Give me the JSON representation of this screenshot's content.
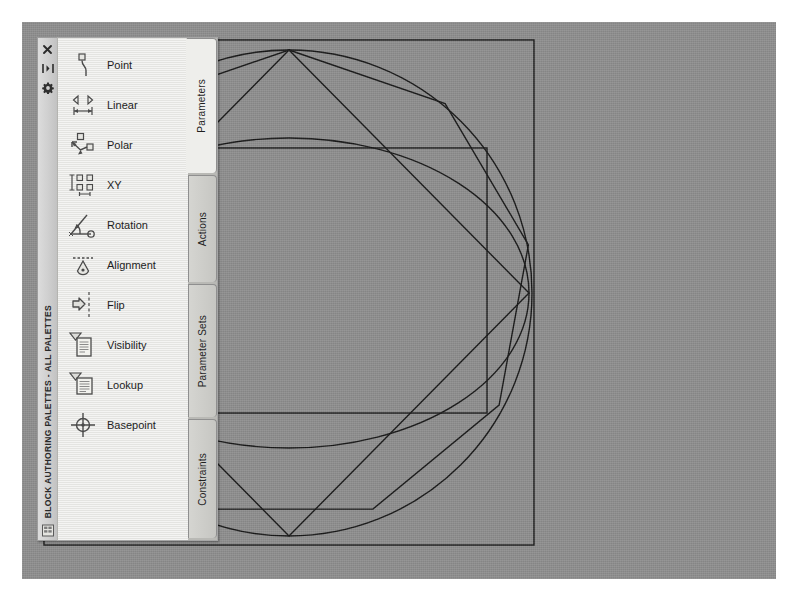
{
  "window": {
    "title": "BLOCK AUTHORING PALETTES - ALL PALETTES",
    "titlebar_icons": [
      {
        "name": "close-icon",
        "glyph": "✕"
      },
      {
        "name": "auto-hide-icon",
        "glyph": "▸◂"
      },
      {
        "name": "properties-gear-icon",
        "glyph": "⚙"
      }
    ],
    "status_icon": "palette-properties-icon"
  },
  "tabs": [
    {
      "label": "Parameters",
      "active": true
    },
    {
      "label": "Actions",
      "active": false
    },
    {
      "label": "Parameter Sets",
      "active": false
    },
    {
      "label": "Constraints",
      "active": false
    }
  ],
  "tools": [
    {
      "label": "Point",
      "icon": "point-parameter-icon"
    },
    {
      "label": "Linear",
      "icon": "linear-parameter-icon"
    },
    {
      "label": "Polar",
      "icon": "polar-parameter-icon"
    },
    {
      "label": "XY",
      "icon": "xy-parameter-icon"
    },
    {
      "label": "Rotation",
      "icon": "rotation-parameter-icon"
    },
    {
      "label": "Alignment",
      "icon": "alignment-parameter-icon"
    },
    {
      "label": "Flip",
      "icon": "flip-parameter-icon"
    },
    {
      "label": "Visibility",
      "icon": "visibility-parameter-icon"
    },
    {
      "label": "Lookup",
      "icon": "lookup-parameter-icon"
    },
    {
      "label": "Basepoint",
      "icon": "basepoint-parameter-icon"
    }
  ],
  "colors": {
    "canvas_background": "#8f8f8f",
    "palette_background": "#e9e9e6",
    "titlebar_background": "#cfcfcf",
    "tab_inactive": "#c6c6c2",
    "tab_active": "#eeeeeb",
    "geometry_stroke": "#1a1a1a",
    "page_background": "#ffffff"
  },
  "drawing": {
    "description": "Block geometry: outer square, circumscribed circle, regular nonagon, rotated inner square, horizontal ellipse and inner rectangle",
    "shapes": [
      {
        "name": "outer-square",
        "type": "rect",
        "x": 22,
        "y": 18,
        "width": 490,
        "height": 505
      },
      {
        "name": "circle",
        "type": "circle",
        "cx": 250,
        "cy": 272,
        "r": 243
      },
      {
        "name": "nonagon",
        "type": "polygon",
        "sides": 9,
        "cx": 250,
        "cy": 272,
        "r": 243,
        "rotation_deg": -90
      },
      {
        "name": "inner-square-rotated",
        "type": "polygon",
        "cx": 250,
        "cy": 272,
        "points": "250,29 490,390 90,390"
      },
      {
        "name": "ellipse",
        "type": "ellipse",
        "cx": 250,
        "cy": 272,
        "rx": 238,
        "ry": 155
      },
      {
        "name": "inner-rectangle",
        "type": "rect",
        "x": 47,
        "y": 126,
        "width": 400,
        "height": 265
      }
    ]
  }
}
